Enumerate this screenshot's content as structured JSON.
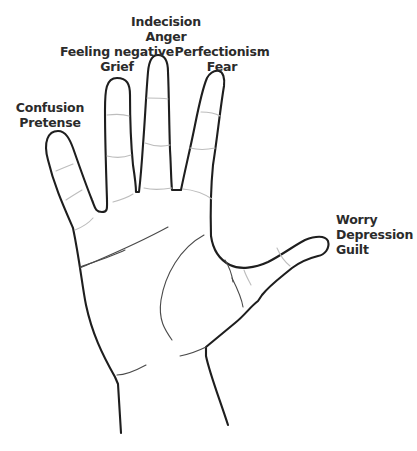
{
  "diagram": {
    "colors": {
      "background": "#ffffff",
      "outline": "#1e1e1e",
      "text": "#2b2b2b",
      "crease": "#bdbdbd"
    },
    "fingers": [
      {
        "id": "pinky",
        "labels": [
          "Confusion",
          "Pretense"
        ]
      },
      {
        "id": "ring",
        "labels": [
          "Feeling negative",
          "Grief"
        ]
      },
      {
        "id": "middle",
        "labels": [
          "Indecision",
          "Anger"
        ]
      },
      {
        "id": "index",
        "labels": [
          "Perfectionism",
          "Fear"
        ]
      },
      {
        "id": "thumb",
        "labels": [
          "Worry",
          "Depression",
          "Guilt"
        ]
      }
    ]
  }
}
